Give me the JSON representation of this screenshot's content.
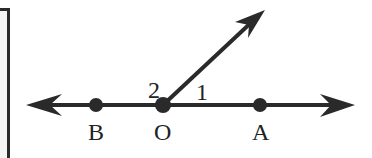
{
  "diagram": {
    "type": "geometry-angle-figure",
    "points": [
      {
        "label": "B",
        "x": 96,
        "y": 105
      },
      {
        "label": "O",
        "x": 163,
        "y": 105
      },
      {
        "label": "A",
        "x": 260,
        "y": 105
      }
    ],
    "angle_labels": [
      {
        "label": "2",
        "x": 150,
        "y": 78
      },
      {
        "label": "1",
        "x": 196,
        "y": 80
      }
    ],
    "line": {
      "from_x": 28,
      "to_x": 355,
      "y": 105,
      "arrows": "both"
    },
    "ray": {
      "from": "O",
      "to_x": 265,
      "to_y": 10
    },
    "stroke_color": "#2a2a2a"
  }
}
